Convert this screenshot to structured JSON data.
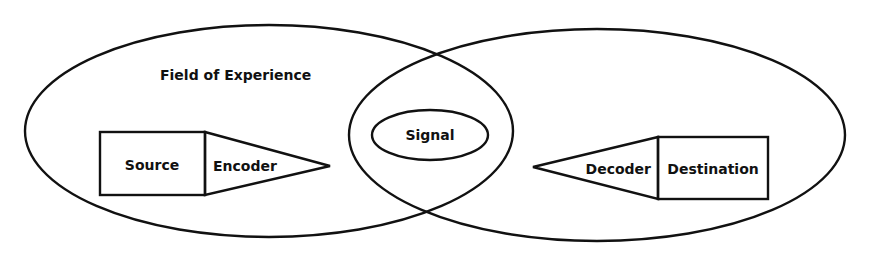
{
  "diagram": {
    "type": "communication-model",
    "title_label": "Field of Experience",
    "nodes": {
      "source": "Source",
      "encoder": "Encoder",
      "signal": "Signal",
      "decoder": "Decoder",
      "destination": "Destination"
    },
    "regions": [
      {
        "name": "sender-field-of-experience",
        "label": "Field of Experience"
      },
      {
        "name": "receiver-field-of-experience",
        "label": ""
      }
    ],
    "flow": [
      "Source",
      "Encoder",
      "Signal",
      "Decoder",
      "Destination"
    ],
    "colors": {
      "stroke": "#111111",
      "background": "#ffffff"
    }
  }
}
